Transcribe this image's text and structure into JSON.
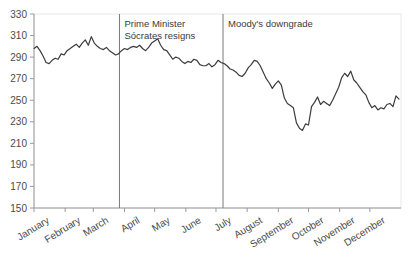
{
  "chart_data": {
    "type": "line",
    "title": "",
    "subtitle": "",
    "xlabel": "",
    "ylabel": "",
    "xlim": [
      0,
      365
    ],
    "ylim": [
      150,
      330
    ],
    "grid": false,
    "legend": "none",
    "line_color": "#3c3c3c",
    "axis_color": "#9a9a9a",
    "annotation_line_color": "#7a7a7a",
    "y_ticks": [
      150,
      170,
      190,
      210,
      230,
      250,
      270,
      290,
      310,
      330
    ],
    "x_tick_labels": [
      "January",
      "February",
      "March",
      "April",
      "May",
      "June",
      "July",
      "August",
      "September",
      "October",
      "November",
      "December"
    ],
    "x_tick_positions": [
      0,
      31,
      59,
      90,
      120,
      151,
      181,
      212,
      243,
      273,
      304,
      334
    ],
    "annotations": [
      {
        "label_line_1": "Prime Minister",
        "label_line_2": "Sócrates resigns",
        "x": 85
      },
      {
        "label_line_1": "Moody's downgrade",
        "label_line_2": "",
        "x": 188
      }
    ],
    "series": [
      {
        "name": "yield spread",
        "x": [
          0,
          3,
          6,
          9,
          12,
          15,
          18,
          21,
          24,
          27,
          30,
          33,
          36,
          39,
          42,
          45,
          48,
          51,
          54,
          57,
          60,
          63,
          66,
          69,
          72,
          75,
          78,
          81,
          84,
          87,
          90,
          93,
          96,
          99,
          102,
          105,
          108,
          111,
          114,
          117,
          120,
          123,
          126,
          129,
          132,
          135,
          138,
          141,
          144,
          147,
          150,
          153,
          156,
          159,
          162,
          165,
          168,
          171,
          174,
          177,
          180,
          183,
          186,
          189,
          192,
          195,
          198,
          201,
          204,
          207,
          210,
          213,
          216,
          219,
          222,
          225,
          228,
          231,
          234,
          237,
          240,
          243,
          246,
          249,
          252,
          255,
          258,
          261,
          264,
          267,
          270,
          273,
          276,
          279,
          282,
          285,
          288,
          291,
          294,
          297,
          300,
          303,
          306,
          309,
          312,
          315,
          318,
          321,
          324,
          327,
          330,
          333,
          336,
          339,
          342,
          345,
          348,
          351,
          354,
          357,
          360,
          363
        ],
        "values": [
          298,
          300,
          296,
          291,
          285,
          284,
          287,
          289,
          288,
          293,
          292,
          296,
          298,
          300,
          302,
          299,
          303,
          306,
          301,
          309,
          303,
          300,
          298,
          297,
          299,
          296,
          294,
          292,
          293,
          296,
          298,
          297,
          299,
          300,
          299,
          301,
          298,
          296,
          299,
          303,
          305,
          307,
          301,
          297,
          296,
          292,
          288,
          290,
          289,
          286,
          284,
          286,
          285,
          288,
          287,
          283,
          282,
          282,
          284,
          281,
          283,
          287,
          285,
          284,
          282,
          279,
          278,
          276,
          273,
          272,
          275,
          280,
          283,
          287,
          286,
          282,
          276,
          270,
          266,
          261,
          265,
          268,
          264,
          252,
          247,
          245,
          243,
          229,
          224,
          222,
          228,
          227,
          244,
          248,
          253,
          246,
          249,
          247,
          245,
          250,
          256,
          262,
          271,
          275,
          272,
          277,
          269,
          266,
          262,
          258,
          255,
          248,
          243,
          245,
          241,
          243,
          242,
          246,
          247,
          244,
          254,
          251
        ]
      }
    ]
  },
  "figure": {
    "background_color": "#ffffff",
    "frame_color": "#e8e8e8"
  }
}
